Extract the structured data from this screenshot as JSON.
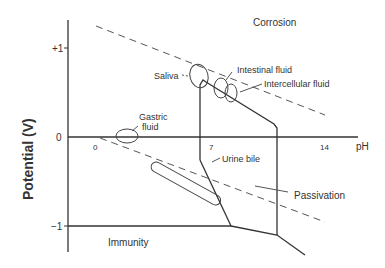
{
  "diagram": {
    "type": "pourbaix",
    "ylabel": "Potential (V)",
    "xlabel": "pH",
    "y_ticks": [
      "+1",
      "0",
      "−1"
    ],
    "x_ticks": [
      "0",
      "7",
      "14"
    ],
    "regions": {
      "corrosion": "Corrosion",
      "passivation": "Passivation",
      "immunity": "Immunity"
    },
    "fluids": {
      "saliva": "Saliva",
      "intestinal": "Intestinal fluid",
      "intercellular": "Intercellular fluid",
      "gastric_line1": "Gastric",
      "gastric_line2": "fluid",
      "urine_bile": "Urine bile"
    },
    "colors": {
      "ink": "#333333",
      "background": "#ffffff"
    }
  }
}
